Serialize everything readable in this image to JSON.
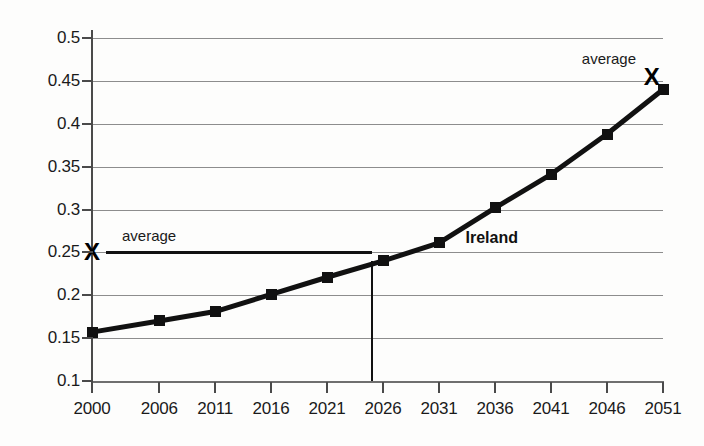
{
  "chart_data": {
    "type": "line",
    "title": "",
    "xlabel": "",
    "ylabel": "",
    "categories": [
      "2000",
      "2006",
      "2011",
      "2016",
      "2021",
      "2026",
      "2031",
      "2036",
      "2041",
      "2046",
      "2051"
    ],
    "x": [
      2000,
      2006,
      2011,
      2016,
      2021,
      2026,
      2031,
      2036,
      2041,
      2046,
      2051
    ],
    "series": [
      {
        "name": "Ireland",
        "values": [
          0.157,
          0.17,
          0.181,
          0.201,
          0.221,
          0.24,
          0.261,
          0.302,
          0.341,
          0.388,
          0.44
        ]
      }
    ],
    "ylim": [
      0.1,
      0.5
    ],
    "ytick_step": 0.05,
    "yticks": [
      "0.1",
      "0.15",
      "0.2",
      "0.25",
      "0.3",
      "0.35",
      "0.4",
      "0.45",
      "0.5"
    ],
    "xticks": [
      "2000",
      "2006",
      "2011",
      "2016",
      "2021",
      "2026",
      "2031",
      "2036",
      "2041",
      "2046",
      "2051"
    ],
    "grid": true,
    "legend": "none",
    "annotations": [
      {
        "name": "average-left",
        "label": "average",
        "marker": "X",
        "marker_value": 0.25,
        "marker_x": 2000,
        "line_from_x": 2000,
        "line_to_x": 2025,
        "line_value": 0.25
      },
      {
        "name": "average-right",
        "label": "average",
        "marker": "X",
        "marker_value": 0.455,
        "marker_x": 2050
      },
      {
        "name": "series-label",
        "label": "Ireland"
      },
      {
        "name": "reference-drop-line",
        "from_value": 0.24,
        "to_value": 0.1,
        "at_x": 2025
      }
    ]
  },
  "colors": {
    "background": "#fdfdfc",
    "series_line": "#111111",
    "gridline": "#8d8d8d",
    "axis": "#4a4a4a",
    "text": "#1a1a1a"
  }
}
